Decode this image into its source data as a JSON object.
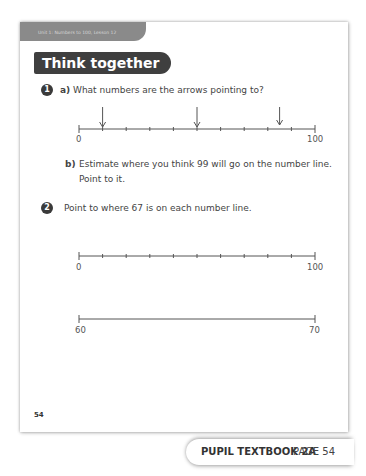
{
  "header": {
    "unit_label": "Unit 1: Numbers to 100, Lesson 12",
    "section_title": "Think together"
  },
  "questions": [
    {
      "number": "1",
      "parts": [
        {
          "letter": "a)",
          "text": "What numbers are the arrows pointing to?"
        },
        {
          "letter": "b)",
          "text_line1": "Estimate where you think 99 will go on the number line.",
          "text_line2": "Point to it."
        }
      ],
      "number_line": {
        "start": "0",
        "end": "100",
        "intervals": 10,
        "arrows_at": [
          10,
          50,
          85
        ]
      }
    },
    {
      "number": "2",
      "text": "Point to where 67 is on each number line.",
      "number_lines": [
        {
          "start": "0",
          "end": "100",
          "intervals": 10
        },
        {
          "start": "60",
          "end": "70",
          "intervals": 1
        }
      ]
    }
  ],
  "footer": {
    "page_number": "54",
    "book_label": "PUPIL TEXTBOOK 2A",
    "page_label": "PAGE 54"
  }
}
